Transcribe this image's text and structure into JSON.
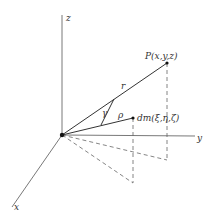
{
  "diagram": {
    "axes": {
      "x": "x",
      "y": "y",
      "z": "z"
    },
    "points": {
      "P": "P(x,y,z)",
      "dm": "dm(ξ,η,ζ)"
    },
    "labels": {
      "r": "r",
      "rho": "ρ",
      "gamma": "γ"
    },
    "colors": {
      "line": "#444444",
      "background": "#ffffff"
    }
  }
}
